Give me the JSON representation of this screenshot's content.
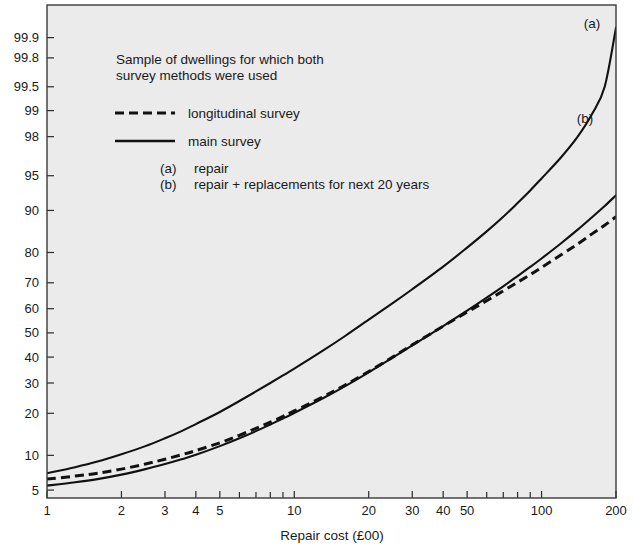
{
  "chart_data": {
    "type": "line",
    "title": "",
    "annotation_title": "Sample of dwellings for which both survey methods were used",
    "xlabel": "Repair cost (£00)",
    "ylabel": "",
    "xscale": "log",
    "yscale": "probability",
    "xlim": [
      1,
      200
    ],
    "ylim": [
      4.2,
      99.97
    ],
    "grid": false,
    "x_ticks_labeled": [
      {
        "value": 1,
        "label": "1"
      },
      {
        "value": 2,
        "label": "2"
      },
      {
        "value": 3,
        "label": "3"
      },
      {
        "value": 4,
        "label": "4"
      },
      {
        "value": 5,
        "label": "5"
      },
      {
        "value": 10,
        "label": "10"
      },
      {
        "value": 20,
        "label": "20"
      },
      {
        "value": 30,
        "label": "30"
      },
      {
        "value": 40,
        "label": "40"
      },
      {
        "value": 50,
        "label": "50"
      },
      {
        "value": 100,
        "label": "100"
      },
      {
        "value": 200,
        "label": "200"
      }
    ],
    "x_ticks_minor": [
      6,
      7,
      8,
      9,
      60,
      70,
      80,
      90
    ],
    "y_ticks": [
      {
        "value": 5,
        "label": "5"
      },
      {
        "value": 10,
        "label": "10"
      },
      {
        "value": 20,
        "label": "20"
      },
      {
        "value": 30,
        "label": "30"
      },
      {
        "value": 40,
        "label": "40"
      },
      {
        "value": 50,
        "label": "50"
      },
      {
        "value": 60,
        "label": "60"
      },
      {
        "value": 70,
        "label": "70"
      },
      {
        "value": 80,
        "label": "80"
      },
      {
        "value": 90,
        "label": "90"
      },
      {
        "value": 95,
        "label": "95"
      },
      {
        "value": 98,
        "label": "98"
      },
      {
        "value": 99,
        "label": "99"
      },
      {
        "value": 99.5,
        "label": "99.5"
      },
      {
        "value": 99.8,
        "label": "99.8"
      },
      {
        "value": 99.9,
        "label": "99.9"
      }
    ],
    "legend": {
      "position": "upper-left-inside",
      "entries": [
        {
          "key": "longitudinal",
          "label": "longitudinal survey",
          "style": "dashed"
        },
        {
          "key": "main",
          "label": "main survey",
          "style": "solid"
        }
      ]
    },
    "curve_key": [
      {
        "tag": "(a)",
        "label": "repair"
      },
      {
        "tag": "(b)",
        "label": "repair + replacements for next 20 years"
      }
    ],
    "curve_tags": [
      {
        "tag": "(a)",
        "x": 160,
        "y": 99.93
      },
      {
        "tag": "(b)",
        "x": 150,
        "y": 98.6
      }
    ],
    "series": [
      {
        "name": "main survey (a) repair",
        "style": "solid",
        "points": [
          [
            1,
            7.1
          ],
          [
            1.3,
            8.0
          ],
          [
            1.6,
            8.9
          ],
          [
            2,
            10.2
          ],
          [
            2.5,
            11.8
          ],
          [
            3,
            13.5
          ],
          [
            3.5,
            15.2
          ],
          [
            4,
            17.0
          ],
          [
            5,
            20.4
          ],
          [
            6,
            23.8
          ],
          [
            7,
            27.0
          ],
          [
            8,
            30.0
          ],
          [
            9,
            32.8
          ],
          [
            10,
            35.4
          ],
          [
            13,
            42.5
          ],
          [
            16,
            48.6
          ],
          [
            20,
            55.5
          ],
          [
            25,
            62.2
          ],
          [
            30,
            67.6
          ],
          [
            40,
            75.6
          ],
          [
            50,
            81.4
          ],
          [
            60,
            85.6
          ],
          [
            70,
            88.8
          ],
          [
            80,
            91.3
          ],
          [
            90,
            93.2
          ],
          [
            100,
            94.7
          ],
          [
            120,
            96.7
          ],
          [
            140,
            98.0
          ],
          [
            160,
            98.9
          ],
          [
            180,
            99.5
          ],
          [
            200,
            99.93
          ]
        ]
      },
      {
        "name": "main survey (b) repair + replacements",
        "style": "solid",
        "points": [
          [
            1,
            5.5
          ],
          [
            1.3,
            5.9
          ],
          [
            1.6,
            6.3
          ],
          [
            2,
            6.9
          ],
          [
            2.5,
            7.7
          ],
          [
            3,
            8.5
          ],
          [
            3.5,
            9.3
          ],
          [
            4,
            10.1
          ],
          [
            5,
            11.8
          ],
          [
            6,
            13.5
          ],
          [
            7,
            15.2
          ],
          [
            8,
            16.9
          ],
          [
            9,
            18.5
          ],
          [
            10,
            20.1
          ],
          [
            13,
            24.6
          ],
          [
            16,
            28.8
          ],
          [
            20,
            34.0
          ],
          [
            25,
            39.8
          ],
          [
            30,
            44.8
          ],
          [
            40,
            52.8
          ],
          [
            50,
            59.2
          ],
          [
            60,
            64.4
          ],
          [
            70,
            68.7
          ],
          [
            80,
            72.4
          ],
          [
            90,
            75.5
          ],
          [
            100,
            78.2
          ],
          [
            120,
            82.6
          ],
          [
            140,
            86.0
          ],
          [
            160,
            88.7
          ],
          [
            180,
            90.8
          ],
          [
            200,
            92.5
          ]
        ]
      },
      {
        "name": "longitudinal survey",
        "style": "dashed",
        "points": [
          [
            1,
            6.3
          ],
          [
            1.3,
            6.7
          ],
          [
            1.6,
            7.1
          ],
          [
            2,
            7.7
          ],
          [
            2.5,
            8.5
          ],
          [
            3,
            9.3
          ],
          [
            3.5,
            10.1
          ],
          [
            4,
            10.9
          ],
          [
            5,
            12.5
          ],
          [
            6,
            14.2
          ],
          [
            7,
            15.9
          ],
          [
            8,
            17.5
          ],
          [
            9,
            19.1
          ],
          [
            10,
            20.7
          ],
          [
            13,
            25.1
          ],
          [
            16,
            29.2
          ],
          [
            20,
            34.3
          ],
          [
            25,
            40.0
          ],
          [
            30,
            45.0
          ],
          [
            40,
            52.8
          ],
          [
            50,
            58.6
          ],
          [
            60,
            63.2
          ],
          [
            70,
            67.0
          ],
          [
            80,
            70.2
          ],
          [
            90,
            72.9
          ],
          [
            100,
            75.3
          ],
          [
            120,
            79.3
          ],
          [
            140,
            82.4
          ],
          [
            160,
            85.0
          ],
          [
            180,
            87.0
          ],
          [
            200,
            88.8
          ]
        ]
      }
    ]
  },
  "colors": {
    "plot_background": "#ebebeb",
    "page_background": "#ffffff",
    "ink": "#111111",
    "frame": "#3a3a3a"
  }
}
